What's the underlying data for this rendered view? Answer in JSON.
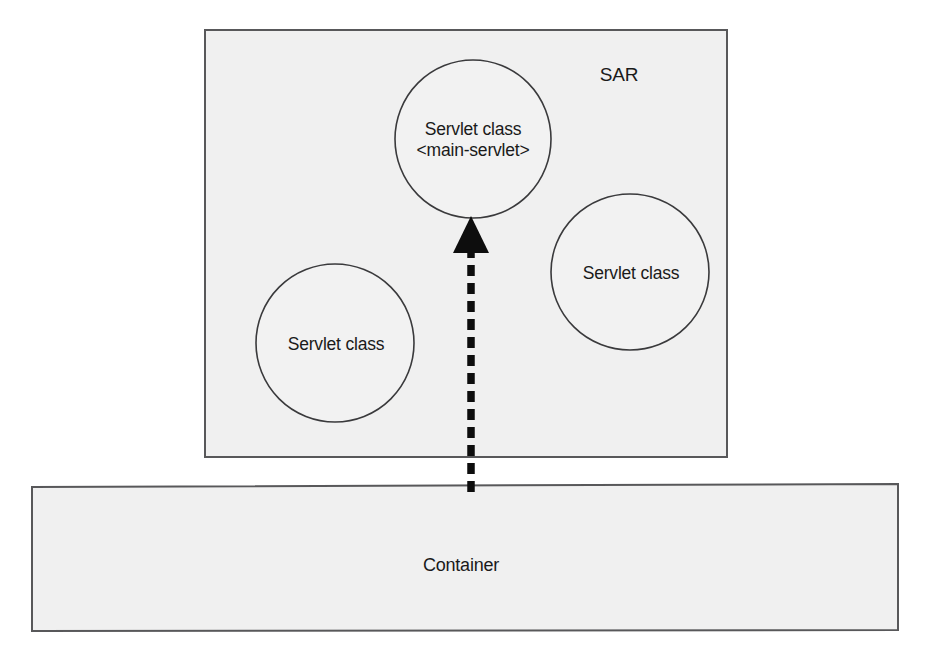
{
  "diagram": {
    "background_color": "#ffffff",
    "box_fill_color": "#f0f0f0",
    "box_stroke_color": "#58585a",
    "circle_stroke_color": "#3a3a3c",
    "connector_color": "#0d0d0d",
    "text_color": "#1a1a1a"
  },
  "sar": {
    "label": "SAR",
    "nodes": [
      {
        "id": "main-servlet",
        "line1": "Servlet class",
        "line2": "<main-servlet>"
      },
      {
        "id": "servlet-left",
        "line1": "Servlet class",
        "line2": ""
      },
      {
        "id": "servlet-right",
        "line1": "Servlet class",
        "line2": ""
      }
    ]
  },
  "container": {
    "label": "Container"
  },
  "connector": {
    "from": "Container",
    "to": "main-servlet",
    "style": "dashed-arrow-up"
  }
}
